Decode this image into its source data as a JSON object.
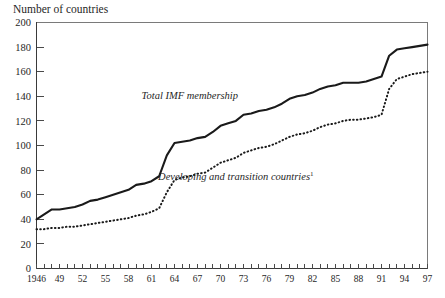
{
  "chart_data": {
    "type": "line",
    "title": "",
    "ylabel": "Number of countries",
    "xlabel": "",
    "ylim": [
      0,
      200
    ],
    "ytick_values": [
      0,
      20,
      40,
      60,
      80,
      100,
      120,
      140,
      160,
      180,
      200
    ],
    "ytick_labels": [
      "0",
      "20",
      "40",
      "60",
      "80",
      "100",
      "120",
      "140",
      "160",
      "180",
      "200"
    ],
    "xlim": [
      1946,
      1997
    ],
    "xtick_labels": [
      "1946",
      "49",
      "52",
      "55",
      "58",
      "61",
      "64",
      "67",
      "70",
      "73",
      "76",
      "79",
      "82",
      "85",
      "88",
      "91",
      "94",
      "97"
    ],
    "xtick_values": [
      1946,
      1949,
      1952,
      1955,
      1958,
      1961,
      1964,
      1967,
      1970,
      1973,
      1976,
      1979,
      1982,
      1985,
      1988,
      1991,
      1994,
      1997
    ],
    "minor_tick_every": 1,
    "grid": false,
    "legend_position": "inline-annotations",
    "x": [
      1946,
      1947,
      1948,
      1949,
      1950,
      1951,
      1952,
      1953,
      1954,
      1955,
      1956,
      1957,
      1958,
      1959,
      1960,
      1961,
      1962,
      1963,
      1964,
      1965,
      1966,
      1967,
      1968,
      1969,
      1970,
      1971,
      1972,
      1973,
      1974,
      1975,
      1976,
      1977,
      1978,
      1979,
      1980,
      1981,
      1982,
      1983,
      1984,
      1985,
      1986,
      1987,
      1988,
      1989,
      1990,
      1991,
      1992,
      1993,
      1994,
      1995,
      1996,
      1997
    ],
    "series": [
      {
        "name": "Total IMF membership",
        "style": "solid",
        "label_x": 1966,
        "label_y": 138,
        "values": [
          40,
          44,
          48,
          48,
          49,
          50,
          52,
          55,
          56,
          58,
          60,
          62,
          64,
          68,
          69,
          71,
          75,
          92,
          102,
          103,
          104,
          106,
          107,
          111,
          116,
          118,
          120,
          125,
          126,
          128,
          129,
          131,
          134,
          138,
          140,
          141,
          143,
          146,
          148,
          149,
          151,
          151,
          151,
          152,
          154,
          156,
          173,
          178,
          179,
          180,
          181,
          182
        ]
      },
      {
        "name": "Developing and transition countries",
        "footnote_marker": "1",
        "style": "dotted",
        "label_x": 1972,
        "label_y": 72,
        "values": [
          32,
          32,
          33,
          33,
          34,
          34,
          35,
          36,
          37,
          38,
          39,
          40,
          41,
          43,
          44,
          46,
          49,
          62,
          72,
          74,
          75,
          77,
          78,
          82,
          86,
          88,
          90,
          94,
          96,
          98,
          99,
          101,
          104,
          107,
          109,
          110,
          112,
          115,
          117,
          118,
          120,
          121,
          121,
          122,
          123,
          125,
          146,
          154,
          156,
          158,
          159,
          160
        ]
      }
    ]
  },
  "footnote": {
    "marker": "1"
  }
}
